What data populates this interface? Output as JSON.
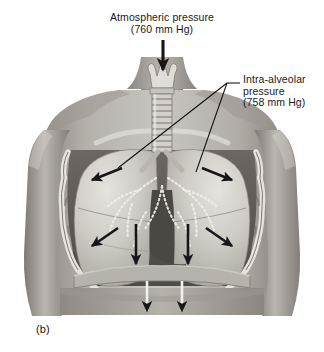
{
  "figure": {
    "caption": "(b)",
    "type": "anatomical-illustration",
    "background_color": "#ffffff"
  },
  "labels": {
    "atmospheric": {
      "line1": "Atmospheric pressure",
      "line2": "(760 mm Hg)",
      "value": 760,
      "unit": "mm Hg"
    },
    "intra_alveolar": {
      "line1": "Intra-alveolar",
      "line2": "pressure",
      "line3": "(758 mm Hg)",
      "value": 758,
      "unit": "mm Hg"
    }
  },
  "colors": {
    "ink": "#1a1a1a",
    "skin_light": "#cdc9c4",
    "skin_mid": "#a6a19b",
    "skin_dark": "#726d68",
    "lung_light": "#d8d5d0",
    "lung_mid": "#b3afa9",
    "cavity_dark": "#5d5954",
    "rib_light": "#e3e0db"
  },
  "arrows": {
    "inflow_label": "air-inflow-arrow",
    "expansion_label": "thoracic-expansion-arrow",
    "diaphragm_label": "diaphragm-descent-arrow",
    "count_expansion": 6,
    "count_diaphragm": 2,
    "count_inflow": 1
  },
  "anatomy": {
    "larynx": "larynx",
    "trachea": "trachea",
    "left_lung": "left-lung",
    "right_lung": "right-lung",
    "bronchial_tree": "bronchial-tree",
    "rib_cage": "rib-cage",
    "diaphragm": "diaphragm",
    "clavicle": "clavicle",
    "heart_notch": "cardiac-notch"
  }
}
